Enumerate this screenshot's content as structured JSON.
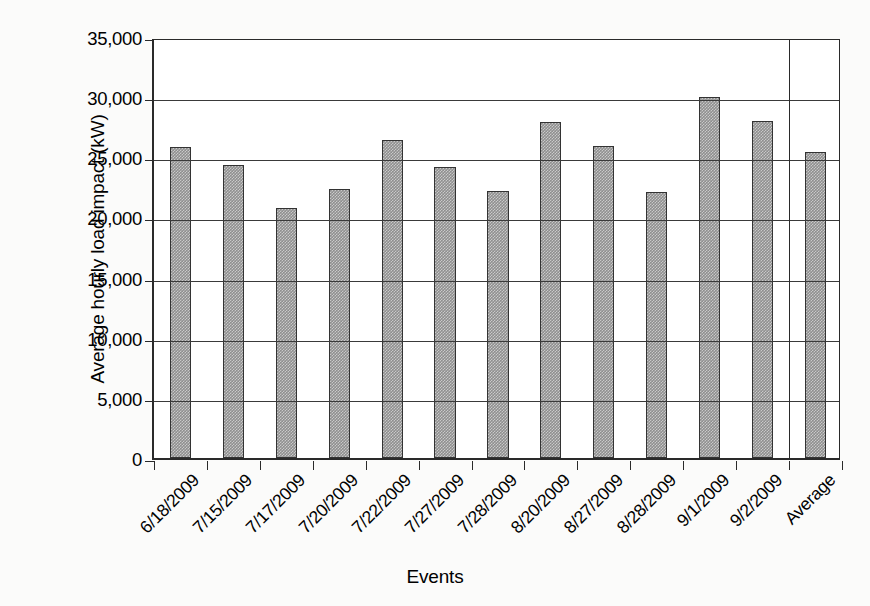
{
  "chart_data": {
    "type": "bar",
    "title": "",
    "xlabel": "Events",
    "ylabel": "Average hourly load impact (kW)",
    "ylim": [
      0,
      35000
    ],
    "ytick_values": [
      0,
      5000,
      10000,
      15000,
      20000,
      25000,
      30000,
      35000
    ],
    "ytick_labels": [
      "0",
      "5,000",
      "10,000",
      "15,000",
      "20,000",
      "25,000",
      "30,000",
      "35,000"
    ],
    "grid": true,
    "legend": "none",
    "categories": [
      "6/18/2009",
      "7/15/2009",
      "7/17/2009",
      "7/20/2009",
      "7/22/2009",
      "7/27/2009",
      "7/28/2009",
      "8/20/2009",
      "8/27/2009",
      "8/28/2009",
      "9/1/2009",
      "9/2/2009",
      "Average"
    ],
    "values": [
      25850,
      24360,
      20750,
      22350,
      26450,
      24200,
      22200,
      27900,
      25950,
      22150,
      30050,
      28000,
      25400
    ],
    "series": [
      {
        "name": "Average hourly load impact (kW)",
        "values": [
          25850,
          24360,
          20750,
          22350,
          26450,
          24200,
          22200,
          27900,
          25950,
          22150,
          30050,
          28000,
          25400
        ]
      }
    ],
    "separator_before_category": "Average",
    "bar_fill_color": "#8f8f8f",
    "bar_border_color": "#333333",
    "axis_color": "#2a2a2a",
    "plot_background": "#ffffff",
    "page_background": "#fbfbfa"
  }
}
